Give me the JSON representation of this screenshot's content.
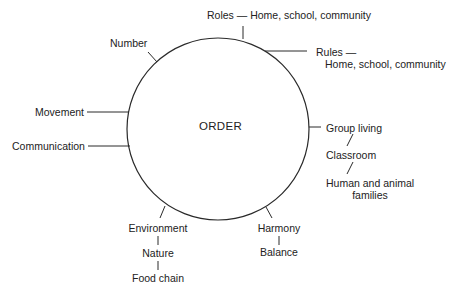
{
  "diagram": {
    "center": {
      "label": "ORDER"
    },
    "colors": {
      "stroke": "#2a2a2a",
      "text": "#222222",
      "background": "#ffffff"
    },
    "branches": {
      "roles": {
        "label": "Roles — Home, school, community"
      },
      "rules": {
        "line1": "Rules —",
        "line2": "Home, school, community"
      },
      "number": {
        "label": "Number"
      },
      "movement": {
        "label": "Movement"
      },
      "communication": {
        "label": "Communication"
      },
      "group_living": {
        "label": "Group living",
        "children": [
          "Classroom",
          "Human and animal",
          "families"
        ]
      },
      "environment": {
        "label": "Environment",
        "children": [
          "Nature",
          "Food chain"
        ]
      },
      "harmony": {
        "label": "Harmony",
        "children": [
          "Balance"
        ]
      },
      "connector_glyph": "|"
    }
  }
}
